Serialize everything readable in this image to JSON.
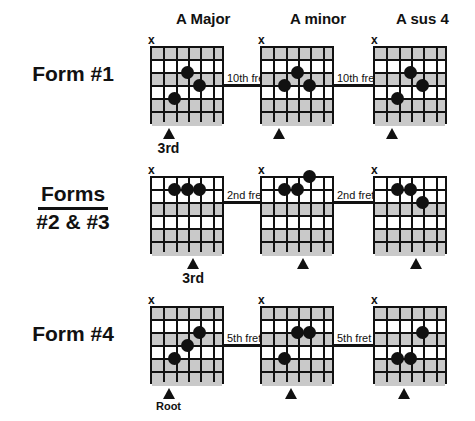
{
  "figure": {
    "background_color": "#ffffff",
    "ink_color": "#111111",
    "shade_color": "#c9c9c9"
  },
  "columns": [
    {
      "label": "A Major"
    },
    {
      "label": "A minor"
    },
    {
      "label": "A sus 4"
    }
  ],
  "rows": [
    {
      "form_label_line1": "Form #1",
      "form_label_line2": "",
      "underlined": false,
      "fret_label": "10th fret",
      "connector_fret_index": 3,
      "diagrams": [
        {
          "chord": "A Major",
          "mute_string": 1,
          "dots": [
            {
              "string": 4,
              "fret": 3
            },
            {
              "string": 5,
              "fret": 4
            },
            {
              "string": 3,
              "fret": 5
            }
          ],
          "marker_string": 2,
          "marker_label": "3rd"
        },
        {
          "chord": "A minor",
          "mute_string": 1,
          "dots": [
            {
              "string": 4,
              "fret": 3
            },
            {
              "string": 3,
              "fret": 4
            },
            {
              "string": 5,
              "fret": 4
            }
          ],
          "marker_string": 2,
          "marker_label": ""
        },
        {
          "chord": "A sus 4",
          "mute_string": 1,
          "dots": [
            {
              "string": 4,
              "fret": 3
            },
            {
              "string": 5,
              "fret": 4
            },
            {
              "string": 3,
              "fret": 5
            }
          ],
          "marker_string": 2,
          "marker_label": ""
        }
      ]
    },
    {
      "form_label_line1": "Forms",
      "form_label_line2": "#2 & #3",
      "underlined": true,
      "fret_label": "2nd fret",
      "connector_fret_index": 2,
      "diagrams": [
        {
          "chord": "A Major",
          "mute_string": 1,
          "dots": [
            {
              "string": 3,
              "fret": 2
            },
            {
              "string": 4,
              "fret": 2
            },
            {
              "string": 5,
              "fret": 2
            }
          ],
          "marker_string": 4,
          "marker_label": "3rd"
        },
        {
          "chord": "A minor",
          "mute_string": 1,
          "dots": [
            {
              "string": 5,
              "fret": 1
            },
            {
              "string": 3,
              "fret": 2
            },
            {
              "string": 4,
              "fret": 2
            }
          ],
          "marker_string": 4,
          "marker_label": ""
        },
        {
          "chord": "A sus 4",
          "mute_string": 1,
          "dots": [
            {
              "string": 3,
              "fret": 2
            },
            {
              "string": 4,
              "fret": 2
            },
            {
              "string": 5,
              "fret": 3
            }
          ],
          "marker_string": 4,
          "marker_label": ""
        }
      ]
    },
    {
      "form_label_line1": "Form #4",
      "form_label_line2": "",
      "underlined": false,
      "fret_label": "5th fret",
      "connector_fret_index": 3,
      "diagrams": [
        {
          "chord": "A Major",
          "mute_string": 1,
          "dots": [
            {
              "string": 5,
              "fret": 3
            },
            {
              "string": 4,
              "fret": 4
            },
            {
              "string": 3,
              "fret": 5
            }
          ],
          "marker_string": 2,
          "marker_label": "Root"
        },
        {
          "chord": "A minor",
          "mute_string": 1,
          "dots": [
            {
              "string": 4,
              "fret": 3
            },
            {
              "string": 5,
              "fret": 3
            },
            {
              "string": 3,
              "fret": 5
            }
          ],
          "marker_string": 3,
          "marker_label": ""
        },
        {
          "chord": "A sus 4",
          "mute_string": 1,
          "dots": [
            {
              "string": 5,
              "fret": 3
            },
            {
              "string": 3,
              "fret": 5
            },
            {
              "string": 4,
              "fret": 5
            }
          ],
          "marker_string": 3,
          "marker_label": ""
        }
      ]
    }
  ],
  "grid_spec": {
    "strings": 6,
    "frets": 6,
    "shaded_fret_rows_row1": [
      1,
      3,
      5,
      6
    ],
    "mute_symbol": "x"
  }
}
